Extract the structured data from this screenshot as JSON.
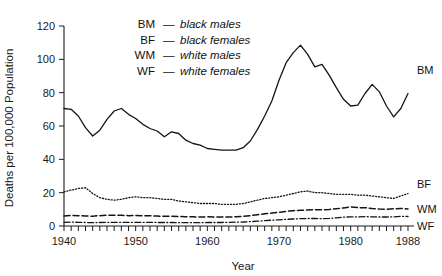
{
  "chart_data": {
    "type": "line",
    "title": "",
    "xlabel": "Year",
    "ylabel": "Deaths per 100,000 Population",
    "xlim": [
      1940,
      1988
    ],
    "ylim": [
      0,
      120
    ],
    "grid": false,
    "legend_position": "upper-center-inside",
    "x": [
      1940,
      1941,
      1942,
      1943,
      1944,
      1945,
      1946,
      1947,
      1948,
      1949,
      1950,
      1951,
      1952,
      1953,
      1954,
      1955,
      1956,
      1957,
      1958,
      1959,
      1960,
      1961,
      1962,
      1963,
      1964,
      1965,
      1966,
      1967,
      1968,
      1969,
      1970,
      1971,
      1972,
      1973,
      1974,
      1975,
      1976,
      1977,
      1978,
      1979,
      1980,
      1981,
      1982,
      1983,
      1984,
      1985,
      1986,
      1987,
      1988
    ],
    "xticks": [
      1940,
      1950,
      1960,
      1970,
      1980,
      1988
    ],
    "xticklabels": [
      "1940",
      "1950",
      "1960",
      "1970",
      "1980",
      "1988"
    ],
    "yticks": [
      0,
      20,
      40,
      60,
      80,
      100,
      120
    ],
    "yticklabels": [
      "0",
      "20",
      "40",
      "60",
      "80",
      "100",
      "120"
    ],
    "series": [
      {
        "name": "BM",
        "label": "black males",
        "legend_key": "BM",
        "legend_dash": "—",
        "legend_desc": "black males",
        "end_label": "BM",
        "linestyle": "solid",
        "values": [
          70.5,
          70.0,
          66.0,
          59.0,
          54.0,
          57.5,
          64.0,
          69.0,
          70.5,
          67.0,
          64.5,
          61.0,
          58.5,
          57.0,
          53.5,
          56.5,
          55.5,
          51.5,
          49.5,
          48.5,
          46.5,
          46.0,
          45.5,
          45.5,
          45.5,
          47.0,
          51.0,
          58.0,
          66.0,
          75.0,
          87.5,
          98.0,
          104.0,
          108.5,
          103.0,
          95.5,
          97.0,
          90.5,
          83.0,
          76.0,
          72.0,
          72.5,
          79.5,
          85.0,
          80.5,
          72.0,
          65.5,
          70.5,
          79.5
        ]
      },
      {
        "name": "BF",
        "label": "black females",
        "legend_key": "BF",
        "legend_dash": "—",
        "legend_desc": "black females",
        "end_label": "BF",
        "linestyle": "dotted",
        "values": [
          20.5,
          21.5,
          22.5,
          23.0,
          19.5,
          17.0,
          16.0,
          15.5,
          16.0,
          17.0,
          17.5,
          17.0,
          17.0,
          16.5,
          16.0,
          16.0,
          15.0,
          14.5,
          14.0,
          13.5,
          13.5,
          13.5,
          13.0,
          13.0,
          13.0,
          13.5,
          14.5,
          15.5,
          16.5,
          17.0,
          17.5,
          18.5,
          19.5,
          20.5,
          21.0,
          20.0,
          20.0,
          19.5,
          19.0,
          19.0,
          19.0,
          18.5,
          18.5,
          18.0,
          17.5,
          17.0,
          16.5,
          18.0,
          19.5
        ]
      },
      {
        "name": "WM",
        "label": "white males",
        "legend_key": "WM",
        "legend_dash": "—",
        "legend_desc": "white males",
        "end_label": "WM",
        "linestyle": "dashed",
        "values": [
          6.0,
          6.3,
          6.2,
          6.0,
          5.9,
          6.2,
          6.5,
          6.5,
          6.4,
          6.2,
          6.3,
          6.2,
          6.1,
          6.0,
          5.8,
          5.8,
          5.7,
          5.6,
          5.5,
          5.4,
          5.5,
          5.4,
          5.4,
          5.4,
          5.5,
          5.8,
          6.2,
          6.8,
          7.3,
          7.8,
          8.2,
          8.8,
          9.2,
          9.4,
          9.6,
          9.8,
          9.7,
          9.9,
          10.4,
          10.8,
          11.5,
          11.0,
          11.0,
          10.5,
          10.2,
          10.0,
          10.3,
          10.5,
          10.2
        ]
      },
      {
        "name": "WF",
        "label": "white females",
        "legend_key": "WF",
        "legend_dash": "—",
        "legend_desc": "white females",
        "end_label": "WF",
        "linestyle": "dashdot",
        "values": [
          2.2,
          2.3,
          2.2,
          2.1,
          2.0,
          2.1,
          2.2,
          2.2,
          2.2,
          2.2,
          2.2,
          2.2,
          2.2,
          2.1,
          2.1,
          2.1,
          2.0,
          2.0,
          2.0,
          2.0,
          2.1,
          2.1,
          2.1,
          2.2,
          2.3,
          2.4,
          2.6,
          2.9,
          3.2,
          3.5,
          3.7,
          4.0,
          4.2,
          4.4,
          4.5,
          4.5,
          4.4,
          4.6,
          4.9,
          5.3,
          5.5,
          5.4,
          5.6,
          5.5,
          5.4,
          5.4,
          5.5,
          5.8,
          5.7
        ]
      }
    ]
  }
}
